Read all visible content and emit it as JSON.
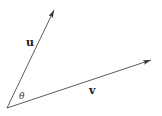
{
  "diagram": {
    "origin": {
      "x": 7,
      "y": 108
    },
    "vectors": [
      {
        "name": "u",
        "label": "u",
        "tip": {
          "x": 54,
          "y": 10
        },
        "label_pos": {
          "x": 26,
          "y": 46
        }
      },
      {
        "name": "v",
        "label": "v",
        "tip": {
          "x": 151,
          "y": 60
        },
        "label_pos": {
          "x": 89,
          "y": 94
        }
      }
    ],
    "angle": {
      "label": "θ",
      "label_pos": {
        "x": 19,
        "y": 99
      }
    },
    "colors": {
      "stroke": "#333333",
      "background": "#ffffff"
    }
  }
}
